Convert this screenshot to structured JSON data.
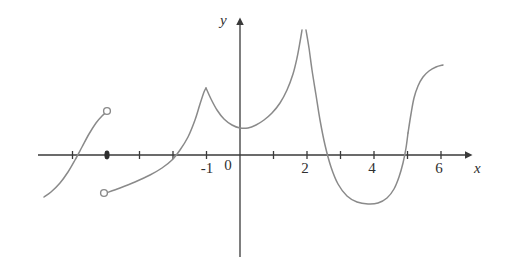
{
  "figure": {
    "kind": "line",
    "background_color": "#ffffff",
    "axis_color": "#3a3a3a",
    "curve_color": "#8a8a8a",
    "text_color": "#2f2f2f"
  },
  "axes": {
    "x_axis_label": "x",
    "y_axis_label": "y",
    "origin_label": "0",
    "x_tick_labels": [
      "-1",
      "2",
      "4",
      "6"
    ],
    "x_ticks_values": [
      -6,
      -5,
      -4,
      -3,
      -2,
      -1,
      1,
      2,
      3,
      4,
      5,
      6
    ],
    "x_range": [
      -6.6,
      6.8
    ],
    "y_range": [
      -3.5,
      4.2
    ],
    "grid": false,
    "x_arrow": true,
    "y_arrow": true
  },
  "chart_data": {
    "type": "line",
    "title": "",
    "xlabel": "x",
    "ylabel": "y",
    "xlim": [
      -6.6,
      6.8
    ],
    "ylim": [
      -3.5,
      4.2
    ],
    "grid": false,
    "legend": "none",
    "unit_px_x": 33.5,
    "unit_px_y": 33.5,
    "origin_px": [
      240,
      155
    ],
    "series": [
      {
        "name": "branch-1-left",
        "comment": "increasing S-shaped arc from lower left, ends at open circle",
        "points_px": [
          [
            44,
            197
          ],
          [
            51,
            192
          ],
          [
            60,
            183
          ],
          [
            68,
            172
          ],
          [
            75,
            160
          ],
          [
            82,
            147
          ],
          [
            89,
            134
          ],
          [
            96,
            123
          ],
          [
            102,
            116
          ],
          [
            107,
            112
          ]
        ]
      },
      {
        "name": "branch-2-left",
        "comment": "starts at open circle below axis, rises to cusp peak at x=-1",
        "points_px": [
          [
            106,
            193
          ],
          [
            120,
            188
          ],
          [
            135,
            182
          ],
          [
            150,
            175
          ],
          [
            162,
            168
          ],
          [
            172,
            160
          ],
          [
            180,
            150
          ],
          [
            188,
            137
          ],
          [
            195,
            120
          ],
          [
            200,
            104
          ],
          [
            204,
            92
          ],
          [
            206,
            88
          ]
        ]
      },
      {
        "name": "branch-3-middle",
        "comment": "from cusp peak at x=-1 down to local min near x=0.2 then up to asymptote at x=2",
        "points_px": [
          [
            206,
            88
          ],
          [
            211,
            99
          ],
          [
            217,
            110
          ],
          [
            224,
            119
          ],
          [
            232,
            125
          ],
          [
            240,
            128
          ],
          [
            248,
            128
          ],
          [
            256,
            125
          ],
          [
            264,
            120
          ],
          [
            272,
            113
          ],
          [
            280,
            103
          ],
          [
            287,
            90
          ],
          [
            293,
            74
          ],
          [
            297,
            58
          ],
          [
            300,
            42
          ],
          [
            302,
            30
          ]
        ]
      },
      {
        "name": "branch-4-right-of-asymptote",
        "comment": "comes down from +infinity right of x=2, crosses axis near x=2.6, dips to min near x=4.1, back up to axis at x=5",
        "points_px": [
          [
            306,
            30
          ],
          [
            309,
            48
          ],
          [
            312,
            70
          ],
          [
            316,
            95
          ],
          [
            320,
            120
          ],
          [
            325,
            145
          ],
          [
            331,
            167
          ],
          [
            338,
            184
          ],
          [
            347,
            196
          ],
          [
            357,
            202
          ],
          [
            368,
            204
          ],
          [
            378,
            203
          ],
          [
            387,
            198
          ],
          [
            394,
            189
          ],
          [
            399,
            177
          ],
          [
            403,
            163
          ],
          [
            406,
            148
          ],
          [
            408,
            133
          ]
        ]
      },
      {
        "name": "branch-5-far-right",
        "comment": "continues steeply upward, flattening toward the right edge",
        "points_px": [
          [
            408,
            133
          ],
          [
            411,
            114
          ],
          [
            414,
            98
          ],
          [
            418,
            86
          ],
          [
            423,
            77
          ],
          [
            429,
            71
          ],
          [
            436,
            67
          ],
          [
            443,
            65
          ]
        ]
      }
    ],
    "markers": [
      {
        "name": "open-circle-end-branch-1",
        "type": "open",
        "px": [
          107,
          111
        ]
      },
      {
        "name": "filled-dot-on-axis",
        "type": "filled",
        "px": [
          107,
          155
        ]
      },
      {
        "name": "open-circle-start-branch-2",
        "type": "open",
        "px": [
          104,
          193
        ]
      }
    ],
    "asymptotes": [
      {
        "name": "vertical-asymptote-x2",
        "x_value": 2,
        "px_x": 303
      }
    ]
  }
}
